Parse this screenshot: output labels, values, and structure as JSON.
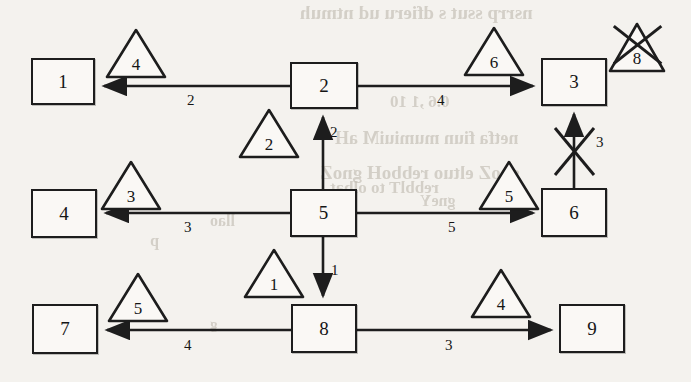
{
  "diagram": {
    "type": "directed-network-flow",
    "title": "",
    "background_color": "#f4f2ee",
    "ink_color": "#1d1d1d",
    "nodes": [
      {
        "id": "n1",
        "label": "1",
        "x": 31,
        "y": 58,
        "w": 64,
        "h": 47
      },
      {
        "id": "n2",
        "label": "2",
        "x": 290,
        "y": 62,
        "w": 68,
        "h": 47
      },
      {
        "id": "n3",
        "label": "3",
        "x": 541,
        "y": 58,
        "w": 66,
        "h": 48
      },
      {
        "id": "n4",
        "label": "4",
        "x": 31,
        "y": 189,
        "w": 66,
        "h": 49
      },
      {
        "id": "n5",
        "label": "5",
        "x": 290,
        "y": 189,
        "w": 67,
        "h": 48
      },
      {
        "id": "n6",
        "label": "6",
        "x": 541,
        "y": 188,
        "w": 66,
        "h": 49
      },
      {
        "id": "n7",
        "label": "7",
        "x": 32,
        "y": 304,
        "w": 66,
        "h": 50
      },
      {
        "id": "n8",
        "label": "8",
        "x": 291,
        "y": 304,
        "w": 66,
        "h": 49
      },
      {
        "id": "n9",
        "label": "9",
        "x": 559,
        "y": 304,
        "w": 66,
        "h": 49
      }
    ],
    "edges": [
      {
        "id": "e2-1",
        "from": "2",
        "to": "1",
        "label": "2",
        "direction": "left",
        "crossed_out": false
      },
      {
        "id": "e2-3",
        "from": "2",
        "to": "3",
        "label": "4",
        "direction": "right",
        "crossed_out": false
      },
      {
        "id": "e5-2",
        "from": "5",
        "to": "2",
        "label": "2",
        "direction": "up",
        "crossed_out": false
      },
      {
        "id": "e5-4",
        "from": "5",
        "to": "4",
        "label": "3",
        "direction": "left",
        "crossed_out": false
      },
      {
        "id": "e5-6",
        "from": "5",
        "to": "6",
        "label": "5",
        "direction": "right",
        "crossed_out": false
      },
      {
        "id": "e5-8",
        "from": "5",
        "to": "8",
        "label": "1",
        "direction": "down",
        "crossed_out": false
      },
      {
        "id": "e6-3",
        "from": "6",
        "to": "3",
        "label": "3",
        "direction": "up",
        "crossed_out": true
      },
      {
        "id": "e8-7",
        "from": "8",
        "to": "7",
        "label": "4",
        "direction": "left",
        "crossed_out": false
      },
      {
        "id": "e8-9",
        "from": "8",
        "to": "9",
        "label": "3",
        "direction": "right",
        "crossed_out": false
      }
    ],
    "triangles": [
      {
        "id": "t1",
        "label": "4",
        "x": 105,
        "y": 28,
        "w": 62,
        "h": 52,
        "crossed_out": false
      },
      {
        "id": "t2",
        "label": "6",
        "x": 463,
        "y": 26,
        "w": 62,
        "h": 52,
        "crossed_out": false
      },
      {
        "id": "t3",
        "label": "8",
        "x": 608,
        "y": 22,
        "w": 58,
        "h": 52,
        "crossed_out": true
      },
      {
        "id": "t4",
        "label": "2",
        "x": 238,
        "y": 108,
        "w": 62,
        "h": 52,
        "crossed_out": false
      },
      {
        "id": "t5",
        "label": "3",
        "x": 100,
        "y": 160,
        "w": 62,
        "h": 52,
        "crossed_out": false
      },
      {
        "id": "t6",
        "label": "5",
        "x": 478,
        "y": 160,
        "w": 62,
        "h": 52,
        "crossed_out": false
      },
      {
        "id": "t7",
        "label": "1",
        "x": 243,
        "y": 248,
        "w": 62,
        "h": 52,
        "crossed_out": false
      },
      {
        "id": "t8",
        "label": "5",
        "x": 107,
        "y": 272,
        "w": 62,
        "h": 52,
        "crossed_out": false
      },
      {
        "id": "t9",
        "label": "4",
        "x": 470,
        "y": 268,
        "w": 62,
        "h": 52,
        "crossed_out": false
      }
    ],
    "bleed_through_text": [
      {
        "text": "nsrrp ssut s dfieru ud ntmuh",
        "x": 300,
        "y": 2,
        "size": 19
      },
      {
        "text": "0.6 ,1 10",
        "x": 390,
        "y": 92,
        "size": 17
      },
      {
        "text": "netfa fiun mumiuiM aH",
        "x": 335,
        "y": 128,
        "size": 18
      },
      {
        "text": "gaoZ eltuo rebboH gnoZ",
        "x": 320,
        "y": 162,
        "size": 19
      },
      {
        "text": "gneY",
        "x": 420,
        "y": 192,
        "size": 16
      },
      {
        "text": "rebblT to olbat",
        "x": 330,
        "y": 178,
        "size": 17
      },
      {
        "text": "llao",
        "x": 210,
        "y": 212,
        "size": 16
      },
      {
        "text": "p",
        "x": 150,
        "y": 232,
        "size": 16
      },
      {
        "text": "g",
        "x": 210,
        "y": 316,
        "size": 15
      }
    ]
  }
}
